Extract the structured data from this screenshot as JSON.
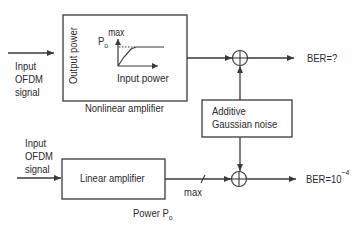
{
  "diagram": {
    "top_path": {
      "input_label": [
        "Input",
        "OFDM",
        "signal"
      ],
      "block_title": "Nonlinear amplifier",
      "inner_graph": {
        "y_axis_label": "Output power",
        "x_axis_label": "Input power",
        "saturation_label_main": "P",
        "saturation_label_sub": "o",
        "saturation_label_sup": "max"
      },
      "output_label": "BER=?"
    },
    "noise_block": {
      "label_line1": "Additive",
      "label_line2": "Gaussian noise"
    },
    "bottom_path": {
      "input_label": [
        "Input",
        "OFDM",
        "signal"
      ],
      "block_title": "Linear amplifier",
      "line_marker_label": "max",
      "power_label_main": "Power P",
      "power_label_sub": "o",
      "output_label_main": "BER=10",
      "output_label_exp": "−4"
    },
    "colors": {
      "stroke": "#3a3a3a",
      "text": "#2a2a2a",
      "background": "#ffffff"
    }
  }
}
